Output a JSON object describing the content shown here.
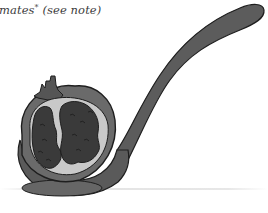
{
  "document": {
    "caption": {
      "text_before": "mates",
      "footnote_mark": "*",
      "text_after": " (see note)"
    },
    "illustration": {
      "subject": "pomegranate-half-on-spoon",
      "colors": {
        "outline": "#1e1e1e",
        "spoon": "#5c5c5c",
        "rind": "#6a6a6a",
        "pith": "#c9c9c9",
        "seeds": "#3a3a3a",
        "crown": "#555555"
      }
    }
  }
}
